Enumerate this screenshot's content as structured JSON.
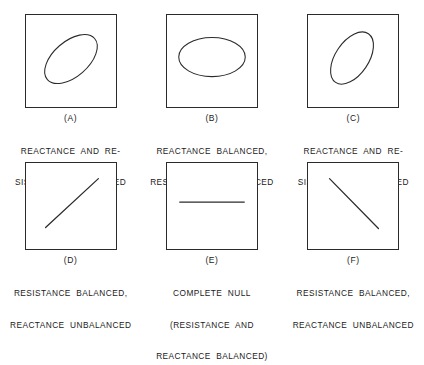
{
  "figure": {
    "line_color": "#2b2b2b",
    "background_color": "#ffffff"
  },
  "panels": [
    {
      "id": "a",
      "label": "(A)",
      "pattern": "tilted-ellipse-right",
      "caption_lines": [
        "REACTANCE  AND  RE-",
        "SISTANCE  UNBALANCED"
      ]
    },
    {
      "id": "b",
      "label": "(B)",
      "pattern": "horizontal-ellipse",
      "caption_lines": [
        "REACTANCE  BALANCED,",
        "RESISTANCE  UNBALANCED"
      ]
    },
    {
      "id": "c",
      "label": "(C)",
      "pattern": "tilted-ellipse-steep",
      "caption_lines": [
        "REACTANCE  AND  RE-",
        "SISTANCE  UNBALANCED"
      ]
    },
    {
      "id": "d",
      "label": "(D)",
      "pattern": "diagonal-line-up",
      "caption_lines": [
        "RESISTANCE  BALANCED,",
        "REACTANCE  UNBALANCED"
      ]
    },
    {
      "id": "e",
      "label": "(E)",
      "pattern": "horizontal-line",
      "caption_lines": [
        "COMPLETE  NULL",
        "(RESISTANCE  AND",
        "REACTANCE  BALANCED)"
      ]
    },
    {
      "id": "f",
      "label": "(F)",
      "pattern": "diagonal-line-down",
      "caption_lines": [
        "RESISTANCE  BALANCED,",
        "REACTANCE  UNBALANCED"
      ]
    }
  ]
}
